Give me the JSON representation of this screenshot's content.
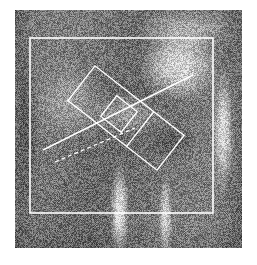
{
  "canvas": {
    "width": 257,
    "height": 265,
    "background_color": "#ffffff"
  },
  "image": {
    "title": "Proximal femur radiograph",
    "modality": "radiograph",
    "color_mode": "grayscale",
    "x": 15,
    "y": 10,
    "width": 227,
    "height": 238,
    "base_gray": "#6e6e6e",
    "texture": "film-grain",
    "anatomy_regions": [
      {
        "name": "femoral-head",
        "cx": 163,
        "cy": 55,
        "rx": 46,
        "ry": 42,
        "brightness": 0.92
      },
      {
        "name": "acetabulum-superior",
        "cx": 170,
        "cy": 18,
        "rx": 58,
        "ry": 26,
        "brightness": 0.7
      },
      {
        "name": "greater-trochanter",
        "cx": 55,
        "cy": 92,
        "rx": 40,
        "ry": 46,
        "brightness": 0.6
      },
      {
        "name": "femoral-neck",
        "cx": 112,
        "cy": 104,
        "rx": 44,
        "ry": 24,
        "brightness": 0.66
      },
      {
        "name": "lesser-trochanter",
        "cx": 158,
        "cy": 132,
        "rx": 26,
        "ry": 22,
        "brightness": 0.3
      },
      {
        "name": "femoral-shaft-cortex-medial",
        "cx": 104,
        "cy": 200,
        "rx": 11,
        "ry": 52,
        "brightness": 1.0
      },
      {
        "name": "femoral-shaft-cortex-lateral",
        "cx": 150,
        "cy": 206,
        "rx": 8,
        "ry": 48,
        "brightness": 0.84
      },
      {
        "name": "femoral-shaft-medullary",
        "cx": 126,
        "cy": 204,
        "rx": 16,
        "ry": 52,
        "brightness": 0.42
      },
      {
        "name": "pelvis-lateral-margin",
        "cx": 208,
        "cy": 120,
        "rx": 12,
        "ry": 70,
        "brightness": 0.88
      },
      {
        "name": "soft-tissue-left",
        "cx": 12,
        "cy": 120,
        "rx": 16,
        "ry": 110,
        "brightness": 0.28
      }
    ]
  },
  "annotations": {
    "stroke_color": "#ffffff",
    "items": [
      {
        "id": "roi-outer-box",
        "label": "Region of interest",
        "shape": "rectangle",
        "x": 15,
        "y": 28,
        "width": 183,
        "height": 175,
        "rotation_deg": 0,
        "stroke_width": 1.6
      },
      {
        "id": "neck-axis-box",
        "label": "Femoral neck measurement band",
        "shape": "rectangle",
        "cx": 111,
        "cy": 108,
        "width": 113,
        "height": 44,
        "rotation_deg": 38,
        "stroke_width": 1.4
      },
      {
        "id": "neck-axis-divider",
        "label": "Band divider",
        "shape": "line",
        "cx": 111,
        "cy": 108,
        "length": 44,
        "rotation_deg": 38,
        "offset": 18,
        "stroke_width": 1.4
      },
      {
        "id": "core-square",
        "label": "Core sampling square",
        "shape": "rectangle",
        "cx": 104,
        "cy": 104,
        "width": 26,
        "height": 26,
        "rotation_deg": 38,
        "stroke_width": 1.3
      },
      {
        "id": "neck-axis-line",
        "label": "Neck axis solid line",
        "shape": "line",
        "x1": 28,
        "y1": 140,
        "x2": 178,
        "y2": 65,
        "dash": "solid",
        "stroke_width": 1.5
      },
      {
        "id": "reference-dashed-line",
        "label": "Reference dashed line",
        "shape": "line",
        "x1": 40,
        "y1": 152,
        "x2": 120,
        "y2": 118,
        "dash": "dashed",
        "dash_pattern": "4 3",
        "stroke_width": 1.3
      }
    ]
  }
}
